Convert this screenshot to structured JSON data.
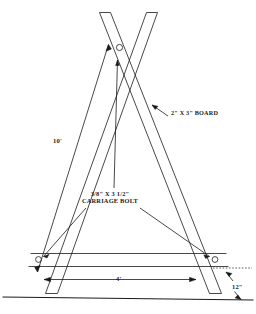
{
  "diagram": {
    "line_color": "#1a1a1a",
    "background_color": "#ffffff",
    "labels": {
      "board": "2\" X 3\" BOARD",
      "leg_length": "10'",
      "bolt_line1": "3/8\" X 3 1/2\"",
      "bolt_line2": "CARRIAGE BOLT",
      "brace_span": "4'",
      "leg_extension": "12\""
    },
    "parts": {
      "left_leg": "left-2x3-board",
      "right_leg": "right-2x3-board",
      "cross_brace": "horizontal-2x3-brace",
      "ground_line": "ground-line",
      "top_bolt": "crossing-carriage-bolt",
      "left_bolt": "left-brace-carriage-bolt",
      "right_bolt": "right-brace-carriage-bolt"
    }
  }
}
